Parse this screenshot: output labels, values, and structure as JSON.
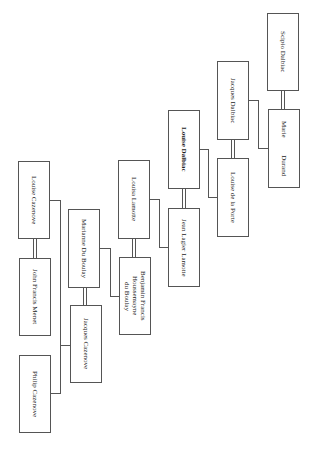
{
  "diagram": {
    "type": "family-tree",
    "orientation": "rotated-90",
    "people": [
      {
        "id": "scipio",
        "name": "Scipio Dalbiac"
      },
      {
        "id": "marie",
        "name": "Marie          Durand"
      },
      {
        "id": "jacques_dalbiac",
        "name": "Jacques Dalbiac"
      },
      {
        "id": "louise_dalbiac",
        "name": "Louise Dalbiac"
      },
      {
        "id": "louise_porte",
        "name": "Louise de la Porte"
      },
      {
        "id": "louisa_lamotte",
        "name": "Louisa Lamotte"
      },
      {
        "id": "jean_lamotte",
        "name": "Jean Lagier Lamotte"
      },
      {
        "id": "marianne",
        "name": "Marianne Du Boulay"
      },
      {
        "id": "benjamin",
        "name": "Benjamin Francis\nHoussemayne\ndu Boulay"
      },
      {
        "id": "jacques_cazenove",
        "name": "Jacques Cazenove"
      },
      {
        "id": "louise_cazenove",
        "name": "Louise Cazenove"
      },
      {
        "id": "john_menet",
        "name": "John Francis Menet"
      },
      {
        "id": "philip",
        "name": "Philip Cazenove"
      }
    ],
    "marriages": [
      [
        "Scipio Dalbiac",
        "Marie Durand"
      ],
      [
        "Louise Dalbiac",
        "Jean Lagier Lamotte"
      ],
      [
        "Louisa Lamotte",
        "Benjamin Francis Houssemayne du Boulay"
      ],
      [
        "Marianne Du Boulay",
        "Jacques Cazenove"
      ],
      [
        "Louise Cazenove",
        "John Francis Menet"
      ],
      [
        "Jacques Dalbiac",
        "Louise de la Porte"
      ]
    ],
    "descents": [
      {
        "parents": [
          "Scipio Dalbiac",
          "Marie Durand"
        ],
        "child": "Jacques Dalbiac"
      },
      {
        "parents": [
          "Jacques Dalbiac",
          "Louise de la Porte"
        ],
        "child": "Louise Dalbiac"
      },
      {
        "parents": [
          "Louise Dalbiac",
          "Jean Lagier Lamotte"
        ],
        "child": "Louisa Lamotte"
      },
      {
        "parents": [
          "Louisa Lamotte",
          "Benjamin Francis Houssemayne du Boulay"
        ],
        "child": "Marianne Du Boulay"
      },
      {
        "parents": [
          "Marianne Du Boulay",
          "Jacques Cazenove"
        ],
        "children": [
          "Louise Cazenove",
          "Philip Cazenove"
        ]
      }
    ]
  }
}
